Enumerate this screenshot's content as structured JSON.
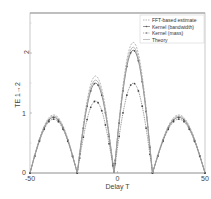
{
  "chart_data": {
    "type": "line",
    "title": "",
    "xlabel": "Delay T",
    "ylabel": "TE 1→2",
    "xlim": [
      -50,
      50
    ],
    "ylim": [
      0,
      2.67
    ],
    "xticks": [
      -50,
      0,
      50
    ],
    "yticks": [
      0,
      1,
      2
    ],
    "grid": false,
    "legend_position": "upper right",
    "legend": [
      "FFT-based estimate",
      "Kernel (bandwidth)",
      "Kernel (mass)",
      "Theory"
    ],
    "series": [
      {
        "name": "FFT-based estimate",
        "style": "dashed",
        "peaks": [
          {
            "x": -35,
            "y": 0.97
          },
          {
            "x": -13,
            "y": 1.62
          },
          {
            "x": 7,
            "y": 2.18
          },
          {
            "x": 33,
            "y": 0.97
          }
        ],
        "zeros": [
          -50,
          -23,
          -2,
          20,
          50
        ]
      },
      {
        "name": "Kernel (bandwidth)",
        "style": "solid-markers",
        "peaks": [
          {
            "x": -35,
            "y": 0.93
          },
          {
            "x": -13,
            "y": 1.5
          },
          {
            "x": 7,
            "y": 2.05
          },
          {
            "x": 33,
            "y": 0.93
          }
        ],
        "zeros": [
          -50,
          -23,
          -2,
          20,
          50
        ]
      },
      {
        "name": "Kernel (mass)",
        "style": "dotted-markers",
        "peaks": [
          {
            "x": -35,
            "y": 0.9
          },
          {
            "x": -13,
            "y": 1.2
          },
          {
            "x": 7,
            "y": 1.5
          },
          {
            "x": 33,
            "y": 0.9
          }
        ],
        "zeros": [
          -50,
          -23,
          -2,
          20,
          50
        ]
      },
      {
        "name": "Theory",
        "style": "solid",
        "peaks": [
          {
            "x": -35,
            "y": 0.95
          },
          {
            "x": -13,
            "y": 1.55
          },
          {
            "x": 7,
            "y": 2.1
          },
          {
            "x": 33,
            "y": 0.95
          }
        ],
        "zeros": [
          -50,
          -23,
          -2,
          20,
          50
        ]
      }
    ]
  },
  "labels": {
    "xlabel": "Delay T",
    "ylabel": "TE 1→2",
    "xtick_neg50": "-50",
    "xtick_0": "0",
    "xtick_50": "50",
    "ytick_0": "0",
    "ytick_1": "1",
    "ytick_2": "2",
    "legend_0": "FFT-based estimate",
    "legend_1": "Kernel (bandwidth)",
    "legend_2": "Kernel (mass)",
    "legend_3": "Theory"
  }
}
